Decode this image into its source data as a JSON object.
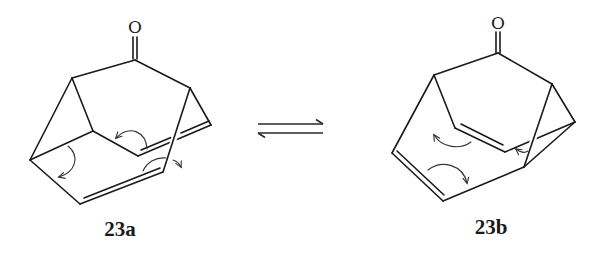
{
  "figure": {
    "type": "chemical-equilibrium-scheme",
    "molecules": [
      {
        "id": "23a",
        "label": "23a",
        "heteroatom_label": "O",
        "features": [
          "ketone C=O",
          "two C=C double bonds",
          "three curved electron-push arrows"
        ]
      },
      {
        "id": "23b",
        "label": "23b",
        "heteroatom_label": "O",
        "features": [
          "ketone C=O",
          "two C=C double bonds",
          "three curved electron-push arrows"
        ]
      }
    ],
    "equilibrium_symbol": "⇌",
    "colors": {
      "ink": "#1a1a1a",
      "background": "#ffffff"
    }
  }
}
